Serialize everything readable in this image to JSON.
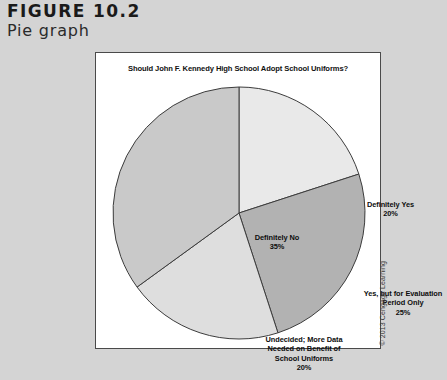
{
  "figure": {
    "number": "FIGURE 10.2",
    "caption": "Pie graph"
  },
  "copyright": "© 2013 Cengage Learning",
  "chart_data": {
    "type": "pie",
    "title": "Should John F. Kennedy High School Adopt School Uniforms?",
    "xlabel": "",
    "ylabel": "",
    "legend": "none",
    "grid": false,
    "start_angle_deg": 0,
    "direction": "clockwise",
    "categories": [
      "Definitely Yes",
      "Yes, but for Evaluation Period Only",
      "Undecided; More Data Needed on Benefit of School Uniforms",
      "Definitely No"
    ],
    "values": [
      20,
      25,
      20,
      35
    ],
    "value_unit": "%",
    "slices": [
      {
        "label": "Definitely Yes",
        "label_lines": "Definitely Yes",
        "value": 20,
        "percent_text": "20%",
        "color": "#e9e9e9"
      },
      {
        "label": "Yes, but for Evaluation Period Only",
        "label_lines": "Yes, but for Evaluation\nPeriod Only",
        "value": 25,
        "percent_text": "25%",
        "color": "#b2b2b2"
      },
      {
        "label": "Undecided; More Data Needed on Benefit of School Uniforms",
        "label_lines": "Undecided; More Data\nNeeded on Benefit of\nSchool Uniforms",
        "value": 20,
        "percent_text": "20%",
        "color": "#dedede"
      },
      {
        "label": "Definitely No",
        "label_lines": "Definitely No",
        "value": 35,
        "percent_text": "35%",
        "color": "#c9c9c9"
      }
    ]
  },
  "colors": {
    "page_background": "#d4d4d4",
    "panel_background": "#ffffff",
    "panel_border": "#4a4a4a",
    "slice_outline": "#3c3c3c",
    "text": "#111111"
  }
}
